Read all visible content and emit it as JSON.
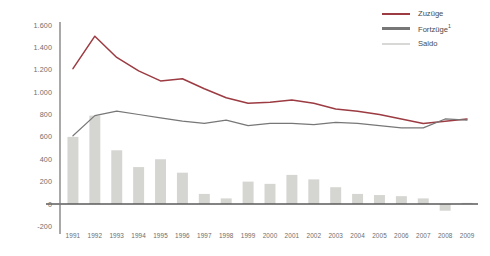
{
  "chart_data": {
    "type": "line",
    "title": "",
    "xlabel": "",
    "ylabel": "",
    "ylim": [
      -200,
      1600
    ],
    "ytick_labels": [
      "1.600",
      "1.400",
      "1.200",
      "1.000",
      "800",
      "600",
      "400",
      "200",
      "0",
      "-200"
    ],
    "ytick_values": [
      1600,
      1400,
      1200,
      1000,
      800,
      600,
      400,
      200,
      0,
      -200
    ],
    "grid": false,
    "legend_position": "top-right",
    "categories": [
      "1991",
      "1992",
      "1993",
      "1994",
      "1995",
      "1996",
      "1997",
      "1998",
      "1999",
      "2000",
      "2001",
      "2002",
      "2003",
      "2004",
      "2005",
      "2006",
      "2007",
      "2008",
      "2009"
    ],
    "series": [
      {
        "name": "Zuzüge",
        "type": "line",
        "color": "#9c3b42",
        "values": [
          1210,
          1500,
          1310,
          1190,
          1100,
          1120,
          1030,
          950,
          900,
          910,
          930,
          900,
          850,
          830,
          800,
          760,
          720,
          740,
          760
        ]
      },
      {
        "name": "Fortzüge",
        "name_suffix": "1",
        "type": "line",
        "color": "#777777",
        "values": [
          610,
          790,
          830,
          800,
          770,
          740,
          720,
          750,
          700,
          720,
          720,
          710,
          730,
          720,
          700,
          680,
          680,
          760,
          750
        ]
      },
      {
        "name": "Saldo",
        "type": "bar",
        "color": "#d5d5d2",
        "values": [
          600,
          790,
          480,
          330,
          400,
          280,
          90,
          50,
          200,
          180,
          260,
          220,
          150,
          90,
          80,
          70,
          50,
          -60,
          10
        ]
      }
    ],
    "legend": [
      {
        "label": "Zuzüge",
        "color": "#9c3b42",
        "suffix": ""
      },
      {
        "label": "Fortzüge",
        "color": "#777777",
        "suffix": "1"
      },
      {
        "label": "Saldo",
        "color": "#d8d8d6",
        "suffix": ""
      }
    ]
  }
}
